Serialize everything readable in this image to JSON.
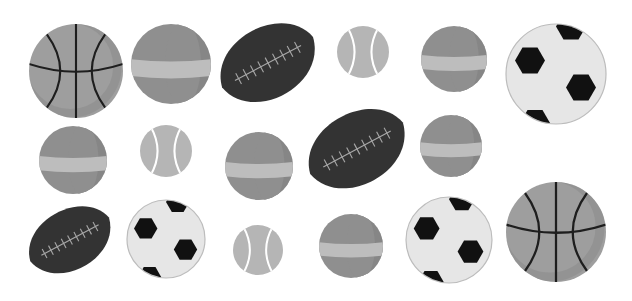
{
  "image": {
    "width": 632,
    "height": 301,
    "background": "#ffffff",
    "description": "Grayscale illustration of assorted sports balls"
  },
  "colors": {
    "basketball_body": "#9e9e9e",
    "basketball_shade": "#8c8c8c",
    "basketball_lines": "#1e1e1e",
    "striped_body": "#8f8f8f",
    "striped_shade": "#808080",
    "striped_band": "#bdbdbd",
    "football_body": "#333333",
    "football_laces": "#a8a8a8",
    "tennis_body": "#b5b5b5",
    "tennis_seam": "#ffffff",
    "soccer_body": "#e6e6e6",
    "soccer_outline": "#bcbcbc",
    "soccer_patch": "#111111"
  },
  "balls": [
    {
      "id": "basketball-1",
      "type": "basketball",
      "cx": 76,
      "cy": 71,
      "r": 47
    },
    {
      "id": "striped-ball-1",
      "type": "striped",
      "cx": 171,
      "cy": 64,
      "r": 40
    },
    {
      "id": "football-1",
      "type": "football",
      "cx": 268,
      "cy": 63,
      "rx": 52,
      "ry": 38,
      "rot": -28
    },
    {
      "id": "tennis-ball-1",
      "type": "tennis",
      "cx": 363,
      "cy": 52,
      "r": 26
    },
    {
      "id": "striped-ball-2",
      "type": "striped",
      "cx": 454,
      "cy": 59,
      "r": 33
    },
    {
      "id": "soccer-ball-1",
      "type": "soccer",
      "cx": 556,
      "cy": 74,
      "r": 50
    },
    {
      "id": "striped-ball-3",
      "type": "striped",
      "cx": 73,
      "cy": 160,
      "r": 34
    },
    {
      "id": "tennis-ball-2",
      "type": "tennis",
      "cx": 166,
      "cy": 151,
      "r": 26
    },
    {
      "id": "striped-ball-4",
      "type": "striped",
      "cx": 259,
      "cy": 166,
      "r": 34
    },
    {
      "id": "football-2",
      "type": "football",
      "cx": 357,
      "cy": 149,
      "rx": 53,
      "ry": 38,
      "rot": -28
    },
    {
      "id": "striped-ball-5",
      "type": "striped",
      "cx": 451,
      "cy": 146,
      "r": 31
    },
    {
      "id": "football-3",
      "type": "football",
      "cx": 70,
      "cy": 240,
      "rx": 45,
      "ry": 32,
      "rot": -28
    },
    {
      "id": "soccer-ball-2",
      "type": "soccer",
      "cx": 166,
      "cy": 239,
      "r": 39
    },
    {
      "id": "tennis-ball-3",
      "type": "tennis",
      "cx": 258,
      "cy": 250,
      "r": 25
    },
    {
      "id": "striped-ball-6",
      "type": "striped",
      "cx": 351,
      "cy": 246,
      "r": 32
    },
    {
      "id": "soccer-ball-3",
      "type": "soccer",
      "cx": 449,
      "cy": 240,
      "r": 43
    },
    {
      "id": "basketball-2",
      "type": "basketball",
      "cx": 556,
      "cy": 232,
      "r": 50
    }
  ]
}
